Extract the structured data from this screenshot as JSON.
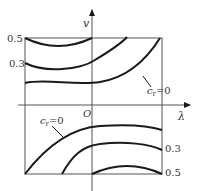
{
  "diagram": {
    "axes": {
      "x_label": "λ",
      "y_label": "v",
      "origin_label": "O"
    },
    "left_tick_labels": [
      "0.5",
      "0.3"
    ],
    "right_tick_labels": [
      "0.3",
      "0.5"
    ],
    "curve_label_upper": {
      "var": "c",
      "sub": "r",
      "rest": "=0"
    },
    "curve_label_lower": {
      "var": "c",
      "sub": "r",
      "rest": "=0"
    },
    "curves": {
      "upper": [
        {
          "name": "0.5",
          "level": 0.5
        },
        {
          "name": "0.3",
          "level": 0.3
        },
        {
          "name": "c_r=0",
          "level": 0
        }
      ],
      "lower": [
        {
          "name": "c_r=0",
          "level": 0
        },
        {
          "name": "0.3",
          "level": 0.3
        },
        {
          "name": "0.5",
          "level": 0.5
        }
      ]
    },
    "colors": {
      "line": "#1a1a1a",
      "frame": "#555555",
      "text": "#333333"
    }
  }
}
